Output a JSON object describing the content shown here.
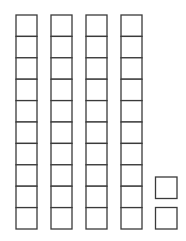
{
  "diagram": {
    "type": "base-ten-blocks",
    "represented_number": 42,
    "tens_rods": 4,
    "cells_per_rod": 10,
    "ones_units": 2,
    "stroke_color": "#3a3a3a",
    "fill_color": "#ffffff"
  }
}
